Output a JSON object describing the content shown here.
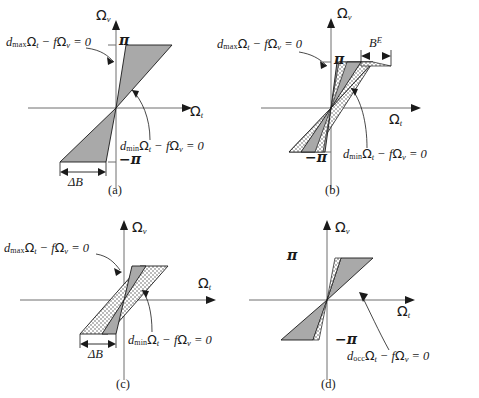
{
  "figure": {
    "colors": {
      "fill_gray": "#a9a9a9",
      "fill_dotted_base": "#ffffff",
      "dot_color": "#555555",
      "stroke": "#1a1a1a",
      "axis": "#6f6f6f",
      "text": "#1a1a1a"
    }
  },
  "axis_labels": {
    "vertical": "Ω",
    "vertical_sub": "v",
    "horizontal": "Ω",
    "horizontal_sub": "t"
  },
  "panels": [
    {
      "id": "a",
      "caption": "(a)",
      "equations": [
        {
          "name": "dmax",
          "lhs_sym": "d",
          "lhs_sub": "max",
          "text": "d_max Ω_t − fΩ_v = 0"
        },
        {
          "name": "dmin",
          "lhs_sym": "d",
          "lhs_sub": "min",
          "text": "d_min Ω_t − fΩ_v = 0"
        }
      ],
      "ticks": [
        {
          "name": "pi-positive",
          "label": "π"
        },
        {
          "name": "pi-negative",
          "label": "−π"
        }
      ],
      "dimension": {
        "name": "delta-B",
        "label": "ΔB"
      },
      "regions": [
        {
          "name": "gray-bowtie",
          "fill": "gray"
        }
      ]
    },
    {
      "id": "b",
      "caption": "(b)",
      "equations": [
        {
          "name": "dmax",
          "lhs_sym": "d",
          "lhs_sub": "max",
          "text": "d_max Ω_t − fΩ_v = 0"
        },
        {
          "name": "dmin",
          "lhs_sym": "d",
          "lhs_sub": "min",
          "text": "d_min Ω_t − fΩ_v = 0"
        }
      ],
      "ticks": [
        {
          "name": "pi-positive",
          "label": "π"
        },
        {
          "name": "pi-negative",
          "label": "−π"
        }
      ],
      "dimension": {
        "name": "B-E",
        "label": "B",
        "sup": "E"
      },
      "regions": [
        {
          "name": "dotted-band",
          "fill": "dotted"
        },
        {
          "name": "gray-bowtie",
          "fill": "gray"
        }
      ]
    },
    {
      "id": "c",
      "caption": "(c)",
      "equations": [
        {
          "name": "dmax",
          "lhs_sym": "d",
          "lhs_sub": "max",
          "text": "d_max Ω_t − fΩ_v = 0"
        },
        {
          "name": "dmin",
          "lhs_sym": "d",
          "lhs_sub": "min",
          "text": "d_min Ω_t − fΩ_v = 0"
        }
      ],
      "ticks": [],
      "dimension": {
        "name": "delta-B",
        "label": "ΔB"
      },
      "regions": [
        {
          "name": "dotted-parallelogram",
          "fill": "dotted"
        },
        {
          "name": "gray-bowtie",
          "fill": "gray"
        }
      ]
    },
    {
      "id": "d",
      "caption": "(d)",
      "equations": [
        {
          "name": "docc",
          "lhs_sym": "d",
          "lhs_sub": "occ",
          "text": "d_occ Ω_t − fΩ_v = 0"
        }
      ],
      "ticks": [
        {
          "name": "pi-positive",
          "label": "π"
        },
        {
          "name": "pi-negative",
          "label": "−π"
        }
      ],
      "dimension": null,
      "regions": [
        {
          "name": "gray-bowtie",
          "fill": "gray"
        },
        {
          "name": "dotted-sliver",
          "fill": "dotted"
        }
      ]
    }
  ],
  "symbols": {
    "minus": "−",
    "equals_zero": "= 0",
    "f": "f",
    "pi": "π",
    "neg_pi": "−π",
    "delta_B": "ΔB",
    "B": "B",
    "E": "E",
    "d": "d",
    "sub_max": "max",
    "sub_min": "min",
    "sub_occ": "occ",
    "sub_t": "t",
    "sub_v": "v"
  }
}
